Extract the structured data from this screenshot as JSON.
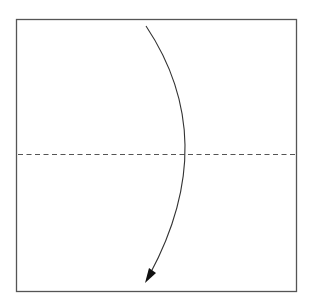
{
  "diagram": {
    "type": "origami-fold-step",
    "paper": {
      "shape": "square",
      "stroke": "#555555"
    },
    "fold_line": {
      "style": "dashed",
      "orientation": "horizontal",
      "position": "middle",
      "kind": "valley-fold",
      "stroke": "#555555"
    },
    "arrow": {
      "direction": "down",
      "style": "curved",
      "meaning": "fold top edge down to bottom edge",
      "stroke": "#333333"
    }
  }
}
